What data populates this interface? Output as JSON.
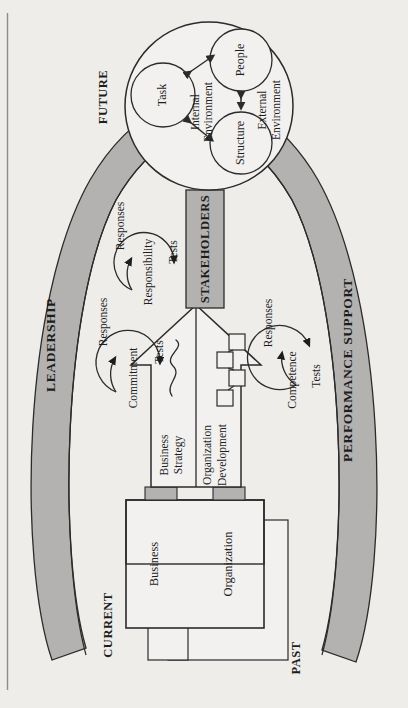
{
  "figure": {
    "background_color": "#eeedea",
    "band_color": "#b3b2b0",
    "stroke_color": "#2b2b2b",
    "panel_fill": "#f2f1ef",
    "orientation_note": "rotated-90-ccw"
  },
  "timeline": {
    "future": "FUTURE",
    "current": "CURRENT",
    "past": "PAST"
  },
  "bands": {
    "left": "LEADERSHIP",
    "right": "PERFORMANCE SUPPORT"
  },
  "arrow": {
    "stakeholders": "STAKEHOLDERS",
    "lane_business": "Business\nStrategy",
    "lane_business_line1": "Business",
    "lane_business_line2": "Strategy",
    "lane_org": "Organization\nDevelopment",
    "lane_org_line1": "Organization",
    "lane_org_line2": "Development"
  },
  "circle": {
    "internal_env_line1": "Internal",
    "internal_env_line2": "Environment",
    "external_env_line1": "External",
    "external_env_line2": "Environment",
    "nodes": [
      {
        "label": "Task"
      },
      {
        "label": "People"
      },
      {
        "label": "Structure"
      }
    ]
  },
  "base_boxes": [
    {
      "label": "Business"
    },
    {
      "label": "Organization"
    }
  ],
  "cycles": [
    {
      "id": "leadership-top",
      "responses": "Responses",
      "driver": "Responsibility",
      "tests": "Tests"
    },
    {
      "id": "leadership-bottom",
      "responses": "Responses",
      "driver": "Commitment",
      "tests": "Tests"
    },
    {
      "id": "performance-support",
      "responses": "Responses",
      "driver": "Competence",
      "tests": "Tests"
    }
  ]
}
